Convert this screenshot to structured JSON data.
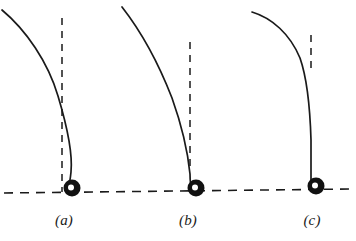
{
  "figure": {
    "type": "scientific-diagram",
    "background_color": "#ffffff",
    "ink_color": "#1a1a1a",
    "width": 356,
    "height": 241,
    "ground": {
      "name": "ground-line",
      "style": "dashed",
      "x1": 4,
      "y1": 193,
      "x2": 352,
      "y2": 189,
      "stroke_width": 1.6,
      "dash": "9 7"
    },
    "panels": [
      {
        "id": "a",
        "label": "(a)",
        "label_x": 64,
        "label_y": 220,
        "rod": {
          "name": "elastic-rod-curve",
          "stroke_width": 1.7,
          "path": "M 2,10 C 26,30 48,62 58,96 C 67,126 73,152 71,172 C 70,182 69,186 68,189",
          "start": [
            2,
            10
          ],
          "end": [
            68,
            189
          ]
        },
        "reference_line": {
          "name": "vertical-reference-line",
          "style": "dashed",
          "x": 62,
          "y_top": 18,
          "y_bottom": 192,
          "stroke_width": 1.5,
          "dash": "7 6"
        },
        "ball": {
          "name": "ball",
          "cx": 72,
          "cy": 188,
          "r": 8.5,
          "fill": "#111111",
          "highlight_r": 3.0,
          "highlight_fill": "#ffffff"
        }
      },
      {
        "id": "b",
        "label": "(b)",
        "label_x": 188,
        "label_y": 220,
        "rod": {
          "name": "elastic-rod-curve",
          "stroke_width": 1.7,
          "path": "M 122,7 C 140,30 158,62 172,98 C 182,126 188,154 190,174 C 190,182 191,186 191,189",
          "start": [
            122,
            7
          ],
          "end": [
            191,
            189
          ]
        },
        "reference_line": {
          "name": "vertical-reference-line",
          "style": "dashed",
          "x": 190,
          "y_top": 42,
          "y_bottom": 168,
          "stroke_width": 1.5,
          "dash": "7 6"
        },
        "ball": {
          "name": "ball",
          "cx": 196,
          "cy": 188,
          "r": 8.5,
          "fill": "#111111",
          "highlight_r": 3.0,
          "highlight_fill": "#ffffff"
        }
      },
      {
        "id": "c",
        "label": "(c)",
        "label_x": 312,
        "label_y": 220,
        "rod": {
          "name": "elastic-rod-curve",
          "stroke_width": 1.7,
          "path": "M 252,12 C 272,18 290,34 300,58 C 307,78 310,106 311,140 C 311,164 311,180 311,188",
          "start": [
            252,
            12
          ],
          "end": [
            311,
            188
          ]
        },
        "reference_line": {
          "name": "vertical-reference-line",
          "style": "dashed",
          "x": 311,
          "y_top": 35,
          "y_bottom": 72,
          "stroke_width": 1.5,
          "dash": "7 6"
        },
        "ball": {
          "name": "ball",
          "cx": 316,
          "cy": 186,
          "r": 8.5,
          "fill": "#111111",
          "highlight_r": 3.0,
          "highlight_fill": "#ffffff"
        }
      }
    ]
  }
}
